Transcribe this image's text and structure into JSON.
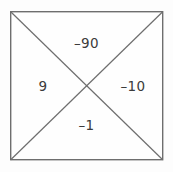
{
  "diagram": {
    "type": "diamond-problem-box",
    "box": {
      "left": 10,
      "top": 11,
      "right": 163,
      "bottom": 160,
      "width": 153,
      "height": 149,
      "border_color": "#6e6e6e",
      "fill_color": "#fefefe",
      "border_width": 1.4
    },
    "diagonals": {
      "color": "#6e6e6e",
      "width": 1.2,
      "intersection_x": 86,
      "intersection_y": 86
    },
    "background_color": "#fdfdfd",
    "text_color": "#3b3b3b",
    "cells": {
      "top": "–90",
      "left": "9",
      "right": "–10",
      "bottom": "–1"
    }
  }
}
